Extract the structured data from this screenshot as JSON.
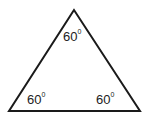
{
  "diagram": {
    "stroke_color": "#1a1a1a",
    "vertices": {
      "top": [
        74,
        10
      ],
      "bottom_left": [
        9,
        111
      ],
      "bottom_right": [
        140,
        111
      ]
    },
    "angles": {
      "top": {
        "value": "60",
        "unit": "0"
      },
      "bottom_left": {
        "value": "60",
        "unit": "0"
      },
      "bottom_right": {
        "value": "60",
        "unit": "0"
      }
    }
  }
}
